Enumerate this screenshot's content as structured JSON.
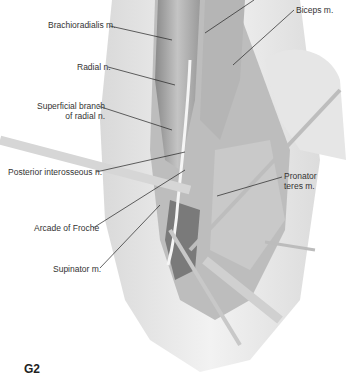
{
  "figure": {
    "id": "G2"
  },
  "labels": [
    {
      "id": "brachioradialis",
      "text": "Brachioradialis m.",
      "x": 48,
      "y": 20,
      "align": "right"
    },
    {
      "id": "biceps",
      "text": "Biceps m.",
      "x": 296,
      "y": 5,
      "align": "left"
    },
    {
      "id": "radial-nerve",
      "text": "Radial n.",
      "x": 77,
      "y": 62,
      "align": "right"
    },
    {
      "id": "superficial-branch",
      "text": [
        "Superficial branch",
        "of radial n."
      ],
      "x": 37,
      "y": 101,
      "align": "right"
    },
    {
      "id": "posterior-interosseous",
      "text": "Posterior interosseous n.",
      "x": 8,
      "y": 167,
      "align": "right"
    },
    {
      "id": "pronator-teres",
      "text": [
        "Pronator",
        "teres m."
      ],
      "x": 284,
      "y": 171,
      "align": "left"
    },
    {
      "id": "arcade-of-frohse",
      "text": "Arcade of Froche",
      "x": 34,
      "y": 223,
      "align": "right"
    },
    {
      "id": "supinator",
      "text": "Supinator m.",
      "x": 53,
      "y": 264,
      "align": "right"
    }
  ],
  "colors": {
    "skin": "#ececec",
    "muscle": "#a8a8a8",
    "dark_tissue": "#6e6e6e",
    "instrument": "#cfcfcf",
    "leader_line": "#222222",
    "label_text": "#333333"
  }
}
